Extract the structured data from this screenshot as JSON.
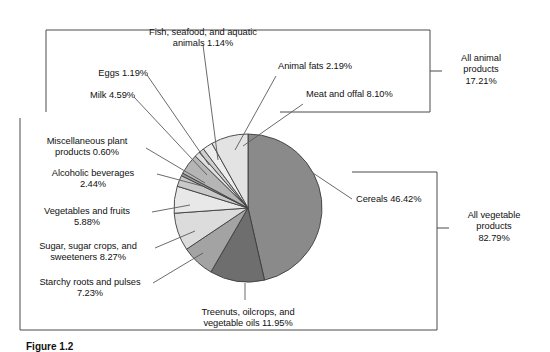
{
  "figure": {
    "caption": "Figure 1.2"
  },
  "groups": {
    "animal": {
      "label": "All animal\nproducts\n17.21%",
      "name": "All animal products",
      "value": 17.21
    },
    "vegetable": {
      "label": "All vegetable\nproducts\n82.79%",
      "name": "All vegetable products",
      "value": 82.79
    }
  },
  "labels": {
    "fish": "Fish, seafood, and aquatic\nanimals 1.14%",
    "eggs": "Eggs 1.19%",
    "milk": "Milk 4.59%",
    "animal_fats": "Animal fats 2.19%",
    "meat": "Meat and offal 8.10%",
    "misc_plant": "Miscellaneous plant\nproducts 0.60%",
    "alcohol": "Alcoholic beverages\n2.44%",
    "veg_fruit": "Vegetables and fruits\n5.88%",
    "sugar": "Sugar, sugar crops, and\nsweeteners 8.27%",
    "starchy": "Starchy roots and pulses\n7.23%",
    "treenuts": "Treenuts, oilcrops, and\nvegetable oils 11.95%",
    "cereals": "Cereals 46.42%"
  },
  "chart_data": {
    "type": "pie",
    "title": "",
    "units": "percent",
    "total": 100.0,
    "start_angle_deg": -90,
    "direction": "clockwise",
    "center": {
      "x": 248,
      "y": 208
    },
    "radius": 74,
    "legend": "labels-with-leader-lines",
    "grid": false,
    "categories": [
      "Cereals",
      "Treenuts, oilcrops, and vegetable oils",
      "Starchy roots and pulses",
      "Sugar, sugar crops, and sweeteners",
      "Vegetables and fruits",
      "Alcoholic beverages",
      "Miscellaneous plant products",
      "Milk",
      "Eggs",
      "Fish, seafood, and aquatic animals",
      "Animal fats",
      "Meat and offal"
    ],
    "values": [
      46.42,
      11.95,
      7.23,
      8.27,
      5.88,
      2.44,
      0.6,
      4.59,
      1.19,
      1.14,
      2.19,
      8.1
    ],
    "colors": [
      "#8a8a8a",
      "#6e6e6e",
      "#a3a3a3",
      "#dcdcdc",
      "#e8e8e8",
      "#c9c9c9",
      "#9a9a9a",
      "#b5b5b5",
      "#e0e0e0",
      "#cfcfcf",
      "#ededed",
      "#e3e3e3"
    ],
    "group_totals": {
      "All vegetable products": 82.79,
      "All animal products": 17.21
    }
  }
}
